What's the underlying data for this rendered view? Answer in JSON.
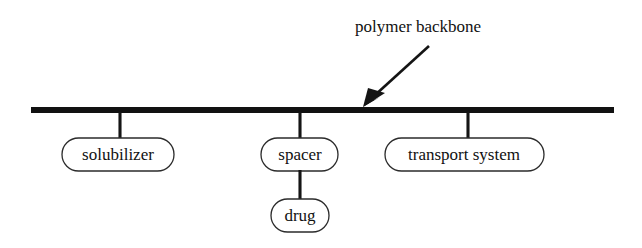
{
  "figure": {
    "title_text": "polymer backbone",
    "background_color": "#ffffff",
    "ink_color": "#111111",
    "annotation": {
      "label": "polymer backbone",
      "label_x": 355,
      "label_y": 28,
      "arrow_tail_x": 429,
      "arrow_tail_y": 46,
      "arrow_tip_x": 363,
      "arrow_tip_y": 107
    },
    "backbone": {
      "name": "polymer backbone",
      "x1": 31,
      "x2": 614,
      "y": 110,
      "thickness": 6
    },
    "nodes": [
      {
        "label": "solubilizer",
        "x": 120,
        "box_left": 62,
        "box_top": 138,
        "box_width": 112,
        "box_height": 33,
        "stem_from_y": 113,
        "stem_to_y": 138
      },
      {
        "label": "spacer",
        "x": 300,
        "box_left": 261,
        "box_top": 138,
        "box_width": 77,
        "box_height": 33,
        "stem_from_y": 113,
        "stem_to_y": 138
      },
      {
        "label": "drug",
        "x": 300,
        "box_left": 271,
        "box_top": 199,
        "box_width": 58,
        "box_height": 33,
        "stem_from_y": 171,
        "stem_to_y": 199
      },
      {
        "label": "transport system",
        "x": 468,
        "box_left": 385,
        "box_top": 138,
        "box_width": 159,
        "box_height": 33,
        "stem_from_y": 113,
        "stem_to_y": 138
      }
    ]
  }
}
